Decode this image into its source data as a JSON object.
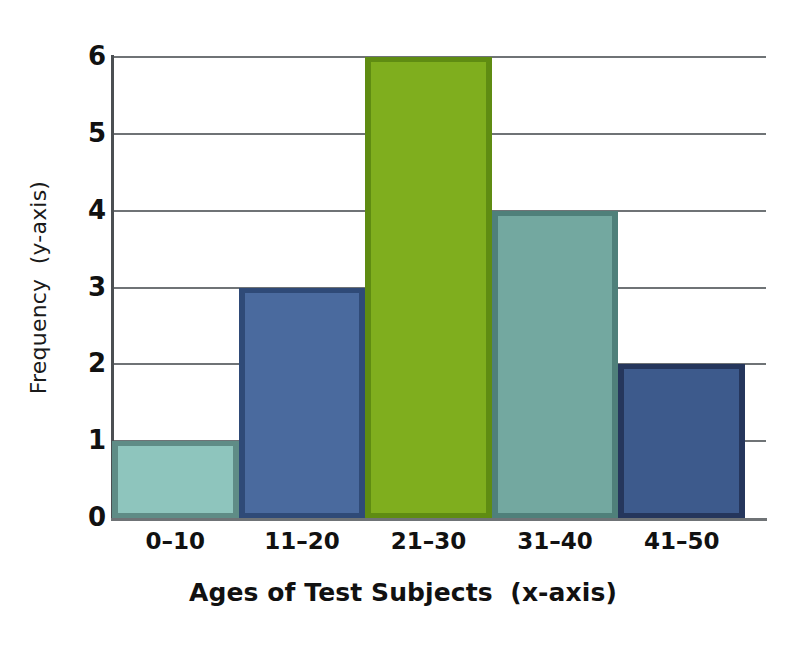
{
  "chart_data": {
    "type": "bar",
    "title": "",
    "subtitle": "",
    "xlabel": "Ages of Test Subjects  (x-axis)",
    "ylabel": "Frequency  (y-axis)",
    "categories": [
      "0–10",
      "11–20",
      "21–30",
      "31–40",
      "41–50"
    ],
    "values": [
      1,
      3,
      6,
      4,
      2
    ],
    "ylim": [
      0,
      6
    ],
    "xlim_note": "categorical, 5 adjacent bins (histogram style, no gaps)",
    "y_ticks": [
      "6",
      "5",
      "4",
      "3",
      "2",
      "1",
      "0"
    ],
    "y_tick_values": [
      6,
      5,
      4,
      3,
      2,
      1,
      0
    ],
    "grid": "horizontal gridlines at every integer y value",
    "legend": "none",
    "annotations": [],
    "bar_colors": [
      "#8ec5bd",
      "#4a6a9e",
      "#7fae1e",
      "#73a8a0",
      "#3d5a8c"
    ],
    "bar_border_colors": [
      "#5f8c86",
      "#2f4a77",
      "#5f8c12",
      "#4f807a",
      "#25365c"
    ],
    "series": [
      {
        "name": "Frequency",
        "values": [
          1,
          3,
          6,
          4,
          2
        ]
      }
    ],
    "points": [
      {
        "category": "0–10",
        "value": 1,
        "color": "#8ec5bd"
      },
      {
        "category": "11–20",
        "value": 3,
        "color": "#4a6a9e"
      },
      {
        "category": "21–30",
        "value": 6,
        "color": "#7fae1e"
      },
      {
        "category": "31–40",
        "value": 4,
        "color": "#73a8a0"
      },
      {
        "category": "41–50",
        "value": 2,
        "color": "#3d5a8c"
      }
    ]
  },
  "axes": {
    "y_title": "Frequency  (y-axis)",
    "x_title": "Ages of Test Subjects  (x-axis)"
  },
  "style": {
    "background": "#ffffff",
    "gridline_color": "#6f7376",
    "axis_color": "#4b4f52",
    "text_color": "#111111"
  }
}
